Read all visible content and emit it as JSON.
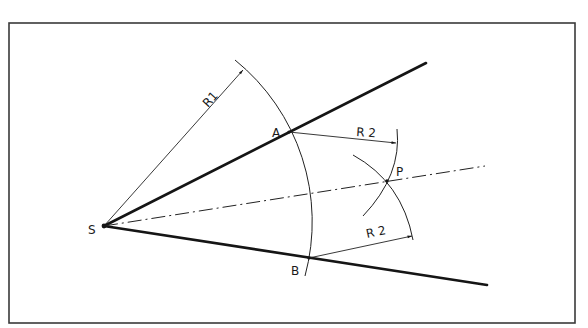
{
  "diagram": {
    "frame": {
      "x": 9,
      "y": 23,
      "width": 566,
      "height": 300
    },
    "points": {
      "S": {
        "label": "S",
        "x": 104,
        "y": 226
      },
      "A": {
        "label": "A",
        "x": 289,
        "y": 132
      },
      "B": {
        "label": "B",
        "x": 309,
        "y": 258
      },
      "P": {
        "label": "P",
        "x": 387,
        "y": 181
      }
    },
    "lines": {
      "upper_leg": {
        "from": [
          104,
          226
        ],
        "to": [
          426,
          63
        ],
        "style": "thick"
      },
      "lower_leg": {
        "from": [
          104,
          226
        ],
        "to": [
          487,
          285
        ],
        "style": "thick"
      },
      "bisector": {
        "from": [
          104,
          226
        ],
        "to": [
          485,
          166
        ],
        "style": "center-line"
      }
    },
    "dimensions": {
      "R1": {
        "label": "R1",
        "from": [
          104,
          226
        ],
        "to": [
          243,
          70
        ]
      },
      "R2_upper": {
        "label": "R 2",
        "from": [
          289,
          132
        ],
        "to": [
          396,
          143
        ]
      },
      "R2_lower": {
        "label": "R 2",
        "from": [
          309,
          258
        ],
        "to": [
          412,
          236
        ]
      }
    },
    "arcs": {
      "R1_arc": {
        "center": "S",
        "radius": 208
      },
      "R2_from_A": {
        "center": "A",
        "radius": 108
      },
      "R2_from_B": {
        "center": "B",
        "radius": 106
      }
    },
    "colors": {
      "ink": "#151515",
      "frame": "#3a3a3a",
      "background": "#ffffff"
    }
  }
}
